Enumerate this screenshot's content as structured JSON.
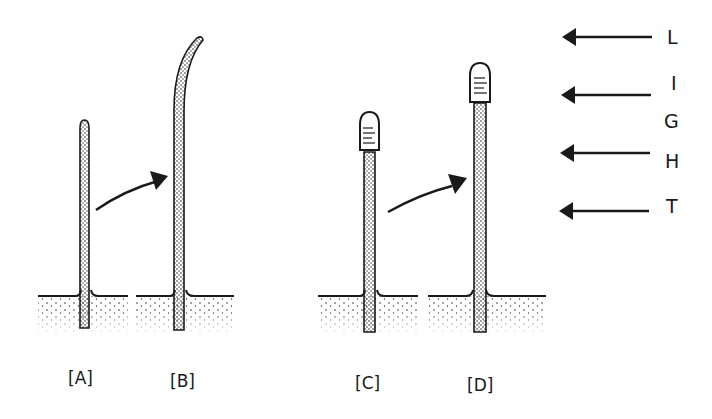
{
  "figure": {
    "panels": [
      {
        "id": "A",
        "label": "[A]",
        "description": "coleoptile, uncovered tip"
      },
      {
        "id": "B",
        "label": "[B]",
        "description": "coleoptile bends toward light"
      },
      {
        "id": "C",
        "label": "[C]",
        "description": "coleoptile with capped tip"
      },
      {
        "id": "D",
        "label": "[D]",
        "description": "capped coleoptile grows straight"
      }
    ],
    "light_label": [
      "L",
      "I",
      "G",
      "H",
      "T"
    ],
    "arrow_icon": "left-arrow",
    "growth_arrow_icon": "curved-arrow",
    "colors": {
      "ink": "#1a1a1a",
      "background": "#ffffff"
    }
  }
}
